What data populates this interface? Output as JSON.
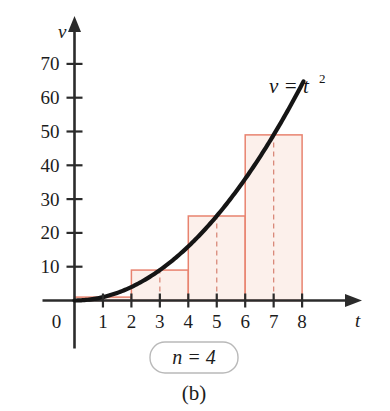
{
  "figure": {
    "caption": "(b)",
    "badge_label": "n = 4",
    "curve_label_main": "v = t",
    "curve_label_exponent": "2",
    "background_color": "#ffffff"
  },
  "chart_data": {
    "type": "area",
    "title": "",
    "subtitle": "",
    "xlabel": "t",
    "ylabel": "v",
    "function_label": "v = t²",
    "xlim": [
      0,
      8.9
    ],
    "ylim": [
      0,
      78
    ],
    "grid": false,
    "legend_position": "none",
    "x_ticks": [
      0,
      1,
      2,
      3,
      4,
      5,
      6,
      7,
      8
    ],
    "x_tick_labels": [
      "0",
      "1",
      "2",
      "3",
      "4",
      "5",
      "6",
      "7",
      "8"
    ],
    "y_ticks": [
      10,
      20,
      30,
      40,
      50,
      60,
      70
    ],
    "y_tick_labels": [
      "10",
      "20",
      "30",
      "40",
      "50",
      "60",
      "70"
    ],
    "curve": {
      "name": "v = t²",
      "expression": "t^2",
      "color": "#151515",
      "line_width": 4.2,
      "x_start": 0,
      "x_end": 8.05,
      "points": [
        {
          "x": 0,
          "y": 0
        },
        {
          "x": 0.5,
          "y": 0.25
        },
        {
          "x": 1,
          "y": 1
        },
        {
          "x": 1.5,
          "y": 2.25
        },
        {
          "x": 2,
          "y": 4
        },
        {
          "x": 2.5,
          "y": 6.25
        },
        {
          "x": 3,
          "y": 9
        },
        {
          "x": 3.5,
          "y": 12.25
        },
        {
          "x": 4,
          "y": 16
        },
        {
          "x": 4.5,
          "y": 20.25
        },
        {
          "x": 5,
          "y": 25
        },
        {
          "x": 5.5,
          "y": 30.25
        },
        {
          "x": 6,
          "y": 36
        },
        {
          "x": 6.5,
          "y": 42.25
        },
        {
          "x": 7,
          "y": 49
        },
        {
          "x": 7.5,
          "y": 56.25
        },
        {
          "x": 8,
          "y": 64
        }
      ]
    },
    "riemann": {
      "method": "midpoint",
      "n": 4,
      "width": 2,
      "edge_color": "#e8836f",
      "fill_color": "#fcf0eb",
      "midpoint_line_color": "#d9897a",
      "bars": [
        {
          "x_start": 0,
          "x_end": 2,
          "midpoint": 1,
          "height": 1
        },
        {
          "x_start": 2,
          "x_end": 4,
          "midpoint": 3,
          "height": 9
        },
        {
          "x_start": 4,
          "x_end": 6,
          "midpoint": 5,
          "height": 25
        },
        {
          "x_start": 6,
          "x_end": 8,
          "midpoint": 7,
          "height": 49
        }
      ]
    },
    "axis_color": "#2b2b2b"
  }
}
